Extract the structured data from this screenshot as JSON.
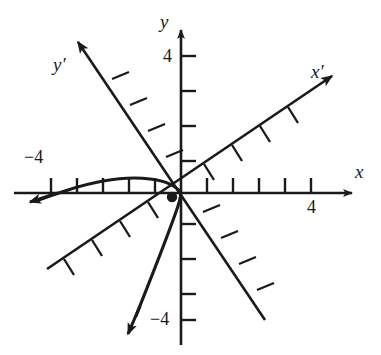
{
  "figure": {
    "type": "rotated-axes-coordinate-diagram",
    "background_color": "#ffffff",
    "ink_color": "#1a1a1a"
  },
  "axes": {
    "x": {
      "label": "x",
      "tick_labels": [
        "4"
      ],
      "labeled_tick_value": 4,
      "negative_tick_label": "−4",
      "ticks_positive": 5,
      "ticks_negative": 5,
      "arrow": "right"
    },
    "y": {
      "label": "y",
      "tick_labels": [
        "4"
      ],
      "labeled_tick_value": 4,
      "negative_tick_label": "−4",
      "ticks_positive": 4,
      "ticks_negative": 4,
      "arrow": "up"
    },
    "x_prime": {
      "label": "x′",
      "rotation_degrees": 30,
      "arrow": "up-right",
      "ticks": 8
    },
    "y_prime": {
      "label": "y′",
      "rotation_degrees": 30,
      "arrow": "up-left",
      "ticks": 8
    }
  },
  "curve": {
    "name": "rotated-parabola",
    "arrow_start": "down-left",
    "arrow_end": "left",
    "passes_through_origin": true
  },
  "point_marker": {
    "name": "vertex-point",
    "on_axis": "x′",
    "label": ""
  },
  "labels": {
    "x_axis": "x",
    "y_axis": "y",
    "x_prime_axis": "x′",
    "y_prime_axis": "y′",
    "x_four": "4",
    "x_minus_four": "−4",
    "y_four": "4",
    "y_minus_four": "−4"
  }
}
